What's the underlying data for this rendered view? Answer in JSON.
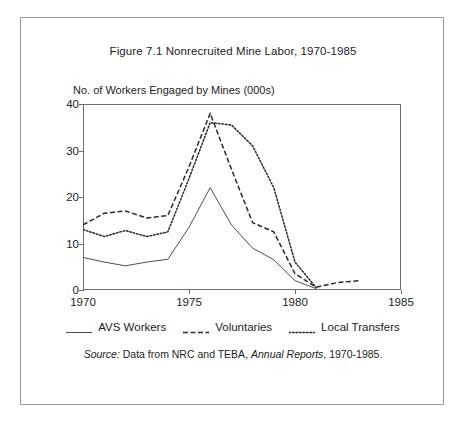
{
  "figure": {
    "title": "Figure 7.1 Nonrecruited Mine Labor, 1970-1985",
    "source_prefix": "Source:",
    "source_text_1": " Data from NRC and TEBA, ",
    "source_italic": "Annual Reports",
    "source_text_2": ", 1970-1985."
  },
  "chart_data": {
    "type": "line",
    "title": "Figure 7.1 Nonrecruited Mine Labor, 1970-1985",
    "subtitle": "",
    "xlabel": "",
    "ylabel": "No. of Workers Engaged by Mines (000s)",
    "xlim": [
      1970,
      1985
    ],
    "ylim": [
      0,
      40
    ],
    "grid": false,
    "legend_position": "bottom",
    "x_ticks": [
      1970,
      1975,
      1980,
      1985
    ],
    "x_tick_labels": [
      "1970",
      "1975",
      "1980",
      "1985"
    ],
    "y_ticks": [
      0,
      10,
      20,
      30,
      40
    ],
    "y_tick_labels": [
      "0",
      "10",
      "20",
      "30",
      "40"
    ],
    "series": [
      {
        "name": "AVS Workers",
        "style": "solid",
        "color": "#3a3a3a",
        "x": [
          1970,
          1971,
          1972,
          1973,
          1974,
          1975,
          1976,
          1977,
          1978,
          1979,
          1980,
          1981
        ],
        "values": [
          7.0,
          6.0,
          5.2,
          6.0,
          6.6,
          13.5,
          22.0,
          14.0,
          9.0,
          6.5,
          2.0,
          0.3
        ]
      },
      {
        "name": "Voluntaries",
        "style": "dashed",
        "color": "#2a2a2a",
        "x": [
          1970,
          1971,
          1972,
          1973,
          1974,
          1975,
          1976,
          1977,
          1978,
          1979,
          1980,
          1981,
          1982,
          1983
        ],
        "values": [
          14.0,
          16.5,
          17.0,
          15.5,
          16.0,
          26.5,
          38.0,
          26.0,
          14.5,
          12.5,
          3.5,
          0.6,
          1.6,
          2.0
        ]
      },
      {
        "name": "Local Transfers",
        "style": "dotted",
        "color": "#2a2a2a",
        "x": [
          1970,
          1971,
          1972,
          1973,
          1974,
          1975,
          1976,
          1977,
          1978,
          1979,
          1980,
          1981
        ],
        "values": [
          13.0,
          11.5,
          12.8,
          11.5,
          12.5,
          24.0,
          36.0,
          35.5,
          31.0,
          22.0,
          6.0,
          0.5
        ]
      }
    ]
  },
  "legend": {
    "items": [
      {
        "label": "AVS Workers",
        "style": "solid"
      },
      {
        "label": "Voluntaries",
        "style": "dashed"
      },
      {
        "label": "Local Transfers",
        "style": "dotted"
      }
    ]
  }
}
